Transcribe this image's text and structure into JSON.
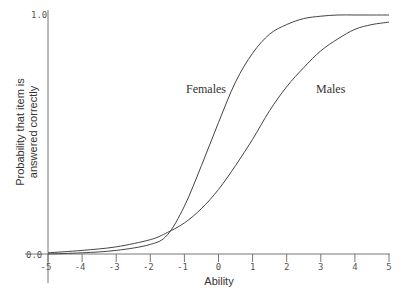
{
  "chart_data": {
    "type": "line",
    "title": "",
    "xlabel": "Ability",
    "ylabel": "Probability that item is answered correctly",
    "xlim": [
      -5,
      5
    ],
    "ylim": [
      0,
      1
    ],
    "x_ticks": [
      "-5",
      "-4",
      "-3",
      "-2",
      "-1",
      "0",
      "1",
      "2",
      "3",
      "4",
      "5"
    ],
    "y_ticks": [
      "0.0",
      "1.0"
    ],
    "grid": false,
    "legend": "inline labels",
    "x": [
      -5,
      -4,
      -3,
      -2,
      -1.5,
      -1,
      -0.5,
      0,
      0.5,
      1,
      1.5,
      2,
      2.5,
      3,
      3.5,
      4,
      4.5,
      5
    ],
    "series": [
      {
        "name": "Females",
        "values": [
          0.0,
          0.005,
          0.015,
          0.04,
          0.08,
          0.2,
          0.37,
          0.55,
          0.72,
          0.84,
          0.92,
          0.96,
          0.985,
          0.995,
          1.0,
          1.0,
          1.0,
          1.0
        ]
      },
      {
        "name": "Males",
        "values": [
          0.005,
          0.015,
          0.03,
          0.06,
          0.09,
          0.13,
          0.19,
          0.27,
          0.37,
          0.48,
          0.6,
          0.7,
          0.78,
          0.85,
          0.9,
          0.94,
          0.96,
          0.97
        ]
      }
    ],
    "annotations": [
      {
        "text": "Females",
        "x": -1.6,
        "y": 0.62
      },
      {
        "text": "Males",
        "x": 1.9,
        "y": 0.62
      }
    ]
  },
  "labels": {
    "y_top": "1.0",
    "y_bottom": "0.0",
    "xlabel": "Ability",
    "ylabel_line1": "Probability that item is",
    "ylabel_line2": "answered correctly",
    "females": "Females",
    "males": "Males"
  }
}
